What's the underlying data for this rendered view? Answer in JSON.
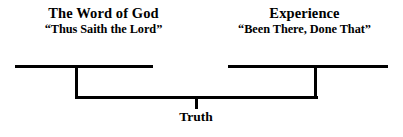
{
  "diagram": {
    "type": "convergence-bracket",
    "background_color": "#ffffff",
    "line_color": "#000000",
    "left_source": {
      "heading": "The Word of God",
      "subheading": "“Thus Saith the Lord”"
    },
    "right_source": {
      "heading": "Experience",
      "subheading": "“Been There, Done That”"
    },
    "conclusion": {
      "label": "Truth"
    }
  }
}
